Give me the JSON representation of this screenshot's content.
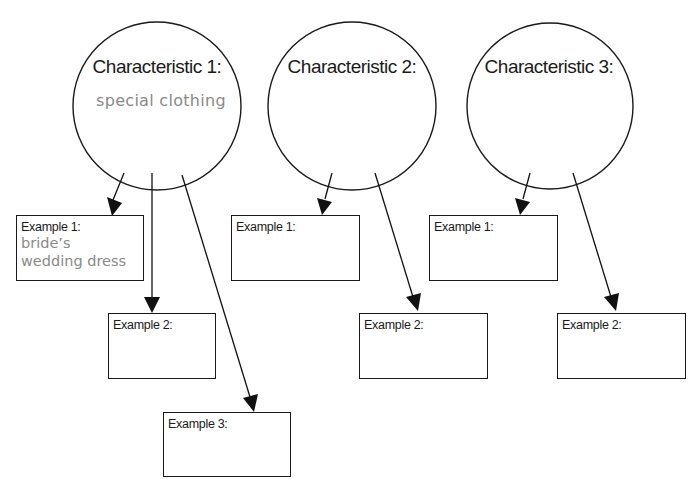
{
  "characteristics": [
    {
      "title": "Characteristic 1:",
      "answer": "special clothing",
      "examples": [
        {
          "label": "Example 1:",
          "answer_line1": "bride’s",
          "answer_line2": "wedding dress"
        },
        {
          "label": "Example 2:",
          "answer_line1": "",
          "answer_line2": ""
        },
        {
          "label": "Example 3:",
          "answer_line1": "",
          "answer_line2": ""
        }
      ]
    },
    {
      "title": "Characteristic 2:",
      "answer": "",
      "examples": [
        {
          "label": "Example 1:"
        },
        {
          "label": "Example 2:"
        }
      ]
    },
    {
      "title": "Characteristic 3:",
      "answer": "",
      "examples": [
        {
          "label": "Example 1:"
        },
        {
          "label": "Example 2:"
        }
      ]
    }
  ],
  "colors": {
    "stroke": "#1a1a1a",
    "handwriting": "#8a8a8a",
    "background": "#ffffff"
  }
}
